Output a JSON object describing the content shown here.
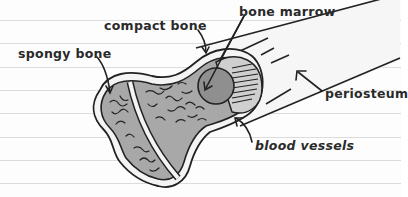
{
  "diagram": {
    "type": "bone-cross-section",
    "style": "hand-drawn sketch on lined paper",
    "colors": {
      "paper": "#fdfdfd",
      "rule_line": "#dcdcdc",
      "ink": "#222222",
      "bone_fill": "#a8a8a8",
      "compact_layer": "#f4f4f4",
      "marrow_fill": "#8f8f8f"
    },
    "ruled_lines_y": [
      20,
      43,
      67,
      90,
      113,
      137,
      160,
      183
    ],
    "labels": {
      "compact_bone": "compact bone",
      "bone_marrow": "bone marrow",
      "spongy_bone": "spongy bone",
      "periosteum": "periosteum",
      "blood_vessels": "blood vessels"
    }
  }
}
